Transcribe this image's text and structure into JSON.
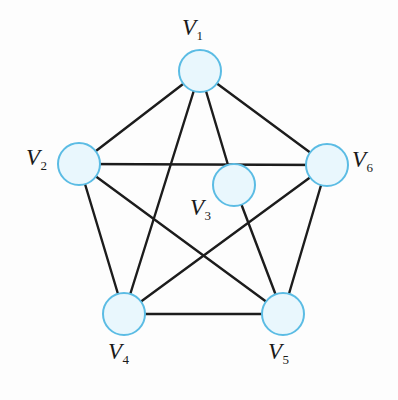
{
  "figure": {
    "type": "undirected-graph-diagram",
    "background_color": "#fdfdfd",
    "edge_color": "#1c1c1c",
    "edge_width": 2.4,
    "node_fill_color": "#e9f7fd",
    "node_stroke_color": "#5bbce4",
    "node_stroke_width": 2,
    "node_radius": 21,
    "label_color": "#1a1a1a"
  },
  "nodes": [
    {
      "id": "V1",
      "letter": "V",
      "subscript": "1",
      "cx": 200,
      "cy": 71,
      "label_x": 182,
      "label_y": 16
    },
    {
      "id": "V2",
      "letter": "V",
      "subscript": "2",
      "cx": 79,
      "cy": 164,
      "label_x": 26,
      "label_y": 146
    },
    {
      "id": "V3",
      "letter": "V",
      "subscript": "3",
      "cx": 234,
      "cy": 185,
      "label_x": 190,
      "label_y": 196
    },
    {
      "id": "V4",
      "letter": "V",
      "subscript": "4",
      "cx": 124,
      "cy": 314,
      "label_x": 108,
      "label_y": 340
    },
    {
      "id": "V5",
      "letter": "V",
      "subscript": "5",
      "cx": 283,
      "cy": 314,
      "label_x": 268,
      "label_y": 340
    },
    {
      "id": "V6",
      "letter": "V",
      "subscript": "6",
      "cx": 327,
      "cy": 165,
      "label_x": 352,
      "label_y": 148
    }
  ],
  "edges": [
    {
      "from": "V1",
      "to": "V2"
    },
    {
      "from": "V1",
      "to": "V6"
    },
    {
      "from": "V1",
      "to": "V3"
    },
    {
      "from": "V1",
      "to": "V4"
    },
    {
      "from": "V2",
      "to": "V6"
    },
    {
      "from": "V2",
      "to": "V4"
    },
    {
      "from": "V2",
      "to": "V5"
    },
    {
      "from": "V3",
      "to": "V5"
    },
    {
      "from": "V4",
      "to": "V5"
    },
    {
      "from": "V4",
      "to": "V6"
    },
    {
      "from": "V5",
      "to": "V6"
    }
  ]
}
